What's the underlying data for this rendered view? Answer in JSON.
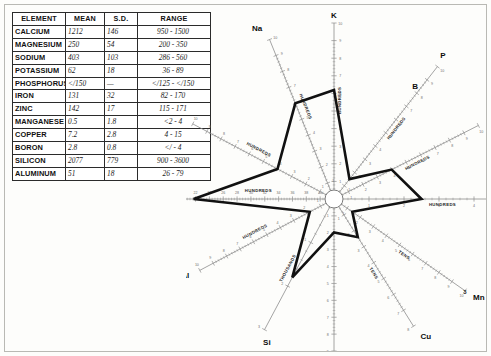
{
  "table": {
    "columns": [
      "ELEMENT",
      "MEAN",
      "S.D.",
      "RANGE"
    ],
    "rows": [
      {
        "element": "CALCIUM",
        "mean": "1212",
        "sd": "146",
        "range": "950 - 1500"
      },
      {
        "element": "MAGNESIUM",
        "mean": "250",
        "sd": "54",
        "range": "200 - 350"
      },
      {
        "element": "SODIUM",
        "mean": "403",
        "sd": "103",
        "range": "286 - 560"
      },
      {
        "element": "POTASSIUM",
        "mean": "62",
        "sd": "18",
        "range": "36 - 89"
      },
      {
        "element": "PHOSPHORUS",
        "mean": "</150",
        "sd": "—",
        "range": "</125 - </150"
      },
      {
        "element": "IRON",
        "mean": "131",
        "sd": "32",
        "range": "82 - 170"
      },
      {
        "element": "ZINC",
        "mean": "142",
        "sd": "17",
        "range": "115 - 171"
      },
      {
        "element": "MANGANESE",
        "mean": "0.5",
        "sd": "1.8",
        "range": "<2 - 4"
      },
      {
        "element": "COPPER",
        "mean": "7.2",
        "sd": "2.8",
        "range": "4 - 15"
      },
      {
        "element": "BORON",
        "mean": "2.8",
        "sd": "0.8",
        "range": "</ - 4"
      },
      {
        "element": "SILICON",
        "mean": "2077",
        "sd": "779",
        "range": "900 - 3600"
      },
      {
        "element": "ALUMINUM",
        "mean": "51",
        "sd": "18",
        "range": "26 - 79"
      }
    ]
  },
  "chart_data": {
    "type": "radar",
    "title": "",
    "center": {
      "x": 148,
      "y": 193
    },
    "axes": [
      {
        "name": "K",
        "label": "K",
        "scale": "HUNDREDS",
        "angle": -90,
        "length": 176,
        "ticks": [
          1,
          2,
          3,
          4,
          5,
          6,
          7,
          8,
          9,
          10
        ],
        "value": 0.62,
        "value_frac": 0.62
      },
      {
        "name": "P",
        "label": "P",
        "scale": "HUNDREDS",
        "angle": -52,
        "length": 168,
        "ticks": [
          1,
          2,
          3,
          4,
          5,
          6,
          7,
          8,
          9,
          10
        ],
        "value": 1.5,
        "value_frac": 0.15
      },
      {
        "name": "B",
        "label": "B",
        "scale": "TENS",
        "angle": -52,
        "length": 168,
        "ticks": [],
        "value": 2.8,
        "value_frac": 0.15
      },
      {
        "name": "Fe",
        "label": "Fe",
        "scale": "HUNDREDS",
        "angle": -27,
        "length": 162,
        "ticks": [
          1,
          2,
          3,
          4,
          5,
          6,
          7,
          8,
          9,
          10
        ],
        "value": 1.31,
        "value_frac": 0.4
      },
      {
        "name": "Zn",
        "label": "Zn",
        "scale": "HUNDREDS",
        "angle": 0,
        "length": 175,
        "ticks": [
          1,
          2,
          3,
          4,
          5
        ],
        "value": 1.42,
        "value_frac": 0.5
      },
      {
        "name": "Mn",
        "label": "Mn",
        "scale": "TENS",
        "angle": 35,
        "length": 160,
        "ticks": [
          1,
          2,
          3,
          4,
          5,
          6,
          7,
          8,
          9,
          10
        ],
        "value": 0.5,
        "value_frac": 0.14
      },
      {
        "name": "Cu",
        "label": "Cu",
        "scale": "TENS",
        "angle": 58,
        "length": 150,
        "ticks": [
          1,
          2,
          3,
          4,
          5,
          6,
          7,
          8
        ],
        "value": 7.2,
        "value_frac": 0.3
      },
      {
        "name": "B2",
        "label": "B",
        "scale": "",
        "angle": 90,
        "length": 152,
        "ticks": [
          1,
          2,
          3,
          4,
          5,
          6,
          7,
          8,
          9
        ],
        "value": 2.8,
        "value_frac": 0.22
      },
      {
        "name": "Si",
        "label": "Si",
        "scale": "THOUSANDS",
        "angle": 118,
        "length": 148,
        "ticks": [
          1,
          2,
          3
        ],
        "value": 2.077,
        "value_frac": 0.6
      },
      {
        "name": "Al",
        "label": "Al",
        "scale": "HUNDREDS",
        "angle": 152,
        "length": 152,
        "ticks": [
          1,
          2,
          3,
          4,
          5,
          6,
          7,
          8,
          9,
          10
        ],
        "value": 0.51,
        "value_frac": 0.18
      },
      {
        "name": "Ca",
        "label": "Ca",
        "scale": "HUNDREDS",
        "angle": 180,
        "length": 180,
        "ticks": [
          40,
          38,
          36,
          34,
          32,
          30,
          28,
          26,
          24,
          22,
          20,
          18,
          16
        ],
        "value": 12.12,
        "value_frac": 0.78
      },
      {
        "name": "Mg",
        "label": "Mg",
        "scale": "HUNDREDS",
        "angle": -152,
        "length": 160,
        "ticks": [
          1,
          2,
          3,
          4,
          5,
          6,
          7,
          8,
          9,
          10
        ],
        "value": 2.5,
        "value_frac": 0.4
      },
      {
        "name": "Na",
        "label": "Na",
        "scale": "HUNDREDS",
        "angle": -112,
        "length": 172,
        "ticks": [
          1,
          2,
          3,
          4,
          5,
          6,
          7,
          8,
          9,
          10
        ],
        "value": 4.03,
        "value_frac": 0.6
      }
    ],
    "scale_labels": [
      "HUNDREDS",
      "TENS",
      "THOUSANDS"
    ],
    "series_name": "mean profile",
    "line_color": "#111111",
    "axis_color": "#8d8d8d"
  }
}
